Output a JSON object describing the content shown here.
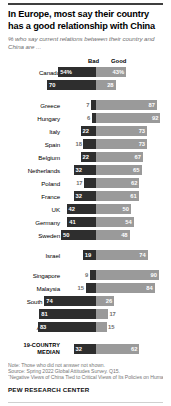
{
  "header": {
    "title": "In Europe, most say their country has a good relationship with China",
    "subtitle": "% who say current relations between their country and China are ..."
  },
  "legend": {
    "bad_label": "Bad",
    "good_label": "Good"
  },
  "footer": {
    "note": "Note: Those who did not answer not shown.",
    "source": "Source: Spring 2022 Global Attitudes Survey. Q15.",
    "report": "“Negative Views of China Tied to Critical Views of Its Policies on Human Rights”",
    "brand": "PEW RESEARCH CENTER"
  },
  "colors": {
    "bad": "#2e2e2e",
    "good": "#9a9a9a",
    "title": "#000000",
    "subtitle": "#6d6d6d",
    "footnote": "#777777"
  },
  "chart_data": {
    "type": "bar",
    "subtype": "diverging-stacked-bar",
    "title": "In Europe, most say their country has a good relationship with China",
    "subtitle": "% who say current relations between their country and China are ...",
    "xlabel": "",
    "ylabel": "",
    "legend": [
      "Bad",
      "Good"
    ],
    "legend_position": "top",
    "grid": false,
    "unit": "percent",
    "categories": [
      "Canada",
      "U.S.",
      "Greece",
      "Hungary",
      "Italy",
      "Spain",
      "Belgium",
      "Netherlands",
      "Poland",
      "France",
      "UK",
      "Germany",
      "Sweden",
      "Israel",
      "Singapore",
      "Malaysia",
      "South Korea",
      "Japan",
      "Australia",
      "19-COUNTRY MEDIAN"
    ],
    "series": [
      {
        "name": "Bad",
        "values": [
          54,
          70,
          7,
          6,
          22,
          18,
          22,
          32,
          17,
          32,
          42,
          41,
          50,
          19,
          9,
          15,
          74,
          81,
          83,
          32
        ]
      },
      {
        "name": "Good",
        "values": [
          43,
          28,
          87,
          92,
          73,
          73,
          67,
          65,
          62,
          61,
          50,
          54,
          48,
          74,
          90,
          84,
          26,
          17,
          15,
          62
        ]
      }
    ]
  },
  "rows": [
    {
      "label": "Canada",
      "bad": 54,
      "good": 43,
      "bad_text": "54%",
      "good_text": "43%",
      "bad_outside": false,
      "good_outside": false,
      "group": 0
    },
    {
      "label": "U.S.",
      "bad": 70,
      "good": 28,
      "bad_text": "70",
      "good_text": "28",
      "bad_outside": false,
      "good_outside": false,
      "group": 0
    },
    {
      "label": "Greece",
      "bad": 7,
      "good": 87,
      "bad_text": "7",
      "good_text": "87",
      "bad_outside": true,
      "good_outside": false,
      "group": 1
    },
    {
      "label": "Hungary",
      "bad": 6,
      "good": 92,
      "bad_text": "6",
      "good_text": "92",
      "bad_outside": true,
      "good_outside": false,
      "group": 1
    },
    {
      "label": "Italy",
      "bad": 22,
      "good": 73,
      "bad_text": "22",
      "good_text": "73",
      "bad_outside": false,
      "good_outside": false,
      "group": 1
    },
    {
      "label": "Spain",
      "bad": 18,
      "good": 73,
      "bad_text": "18",
      "good_text": "73",
      "bad_outside": true,
      "good_outside": false,
      "group": 1
    },
    {
      "label": "Belgium",
      "bad": 22,
      "good": 67,
      "bad_text": "22",
      "good_text": "67",
      "bad_outside": false,
      "good_outside": false,
      "group": 1
    },
    {
      "label": "Netherlands",
      "bad": 32,
      "good": 65,
      "bad_text": "32",
      "good_text": "65",
      "bad_outside": false,
      "good_outside": false,
      "group": 1
    },
    {
      "label": "Poland",
      "bad": 17,
      "good": 62,
      "bad_text": "17",
      "good_text": "62",
      "bad_outside": true,
      "good_outside": false,
      "group": 1
    },
    {
      "label": "France",
      "bad": 32,
      "good": 61,
      "bad_text": "32",
      "good_text": "61",
      "bad_outside": false,
      "good_outside": false,
      "group": 1
    },
    {
      "label": "UK",
      "bad": 42,
      "good": 50,
      "bad_text": "42",
      "good_text": "50",
      "bad_outside": false,
      "good_outside": false,
      "group": 1
    },
    {
      "label": "Germany",
      "bad": 41,
      "good": 54,
      "bad_text": "41",
      "good_text": "54",
      "bad_outside": false,
      "good_outside": false,
      "group": 1
    },
    {
      "label": "Sweden",
      "bad": 50,
      "good": 48,
      "bad_text": "50",
      "good_text": "48",
      "bad_outside": false,
      "good_outside": false,
      "group": 1
    },
    {
      "label": "Israel",
      "bad": 19,
      "good": 74,
      "bad_text": "19",
      "good_text": "74",
      "bad_outside": false,
      "good_outside": false,
      "group": 2
    },
    {
      "label": "Singapore",
      "bad": 9,
      "good": 90,
      "bad_text": "9",
      "good_text": "90",
      "bad_outside": true,
      "good_outside": false,
      "group": 3
    },
    {
      "label": "Malaysia",
      "bad": 15,
      "good": 84,
      "bad_text": "15",
      "good_text": "84",
      "bad_outside": true,
      "good_outside": false,
      "group": 3
    },
    {
      "label": "South Korea",
      "bad": 74,
      "good": 26,
      "bad_text": "74",
      "good_text": "26",
      "bad_outside": false,
      "good_outside": false,
      "group": 3
    },
    {
      "label": "Japan",
      "bad": 81,
      "good": 17,
      "bad_text": "81",
      "good_text": "17",
      "bad_outside": false,
      "good_outside": true,
      "group": 3
    },
    {
      "label": "Australia",
      "bad": 83,
      "good": 15,
      "bad_text": "83",
      "good_text": "15",
      "bad_outside": false,
      "good_outside": true,
      "group": 3
    },
    {
      "label": "19-COUNTRY MEDIAN",
      "bad": 32,
      "good": 62,
      "bad_text": "32",
      "good_text": "62",
      "bad_outside": false,
      "good_outside": false,
      "group": 4,
      "median": true
    }
  ]
}
